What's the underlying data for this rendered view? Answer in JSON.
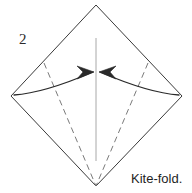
{
  "figure": {
    "step_number": "2",
    "caption": "Kite-fold.",
    "title": "Origami kite-fold diagram",
    "colors": {
      "outline": "#3a3a3a",
      "dashed_fold": "#7a7a7a",
      "center_line": "#a8a8a8",
      "arrow": "#2a2a2a",
      "text": "#1e1e1e",
      "background": "#ffffff"
    },
    "shape": {
      "name": "square-rotated-diamond",
      "vertices": {
        "top": [
          96,
          5
        ],
        "right": [
          182,
          96
        ],
        "bottom": [
          96,
          186
        ],
        "left": [
          11,
          96
        ]
      }
    },
    "center_line": {
      "name": "vertical-crease-line",
      "from": [
        96,
        38
      ],
      "to": [
        96,
        161
      ]
    },
    "fold_lines": [
      {
        "name": "left-dashed-fold-line",
        "from": [
          44,
          63
        ],
        "to": [
          96,
          186
        ],
        "style": "dashed"
      },
      {
        "name": "right-dashed-fold-line",
        "from": [
          148,
          63
        ],
        "to": [
          96,
          186
        ],
        "style": "dashed"
      }
    ],
    "arrows": [
      {
        "name": "left-fold-arrow",
        "direction": "left-edge-to-center",
        "tail": [
          14,
          95
        ],
        "head": [
          93,
          72
        ],
        "control": [
          44,
          93
        ]
      },
      {
        "name": "right-fold-arrow",
        "direction": "right-edge-to-center",
        "tail": [
          179,
          95
        ],
        "head": [
          99,
          72
        ],
        "control": [
          149,
          93
        ]
      }
    ],
    "labels": {
      "step_number_pos": [
        19,
        44
      ],
      "caption_pos": [
        131,
        183
      ]
    }
  }
}
